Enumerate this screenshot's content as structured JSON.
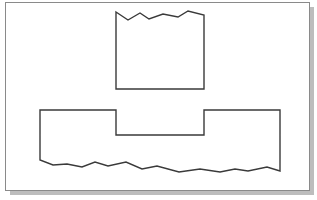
{
  "diagram": {
    "type": "broken-section-drawing",
    "frame": {
      "x": 5,
      "y": 2,
      "width": 304,
      "height": 188,
      "border_color": "#8a8a8a",
      "fill": "#ffffff",
      "shadow_color": "#bdbdbd",
      "shadow_offset": 5
    },
    "stroke_color": "#3a3a3a",
    "stroke_width": 1.4,
    "shapes": [
      {
        "name": "upper-block",
        "description": "Rectangular block with jagged (broken) top edge",
        "points": "116,12 128,20 140,13 149,19 163,14 178,17 188,11 204,15 204,89 116,89"
      },
      {
        "name": "lower-notched-block",
        "description": "Block with rectangular notch at top center and jagged (broken) bottom edge",
        "points": "40,110 116,110 116,135 204,135 204,110 280,110 280,171 267,167 248,171 235,169 220,172 200,169 179,172 157,166 142,169 126,162 108,166 95,162 82,167 67,164 53,165 40,160"
      }
    ]
  }
}
